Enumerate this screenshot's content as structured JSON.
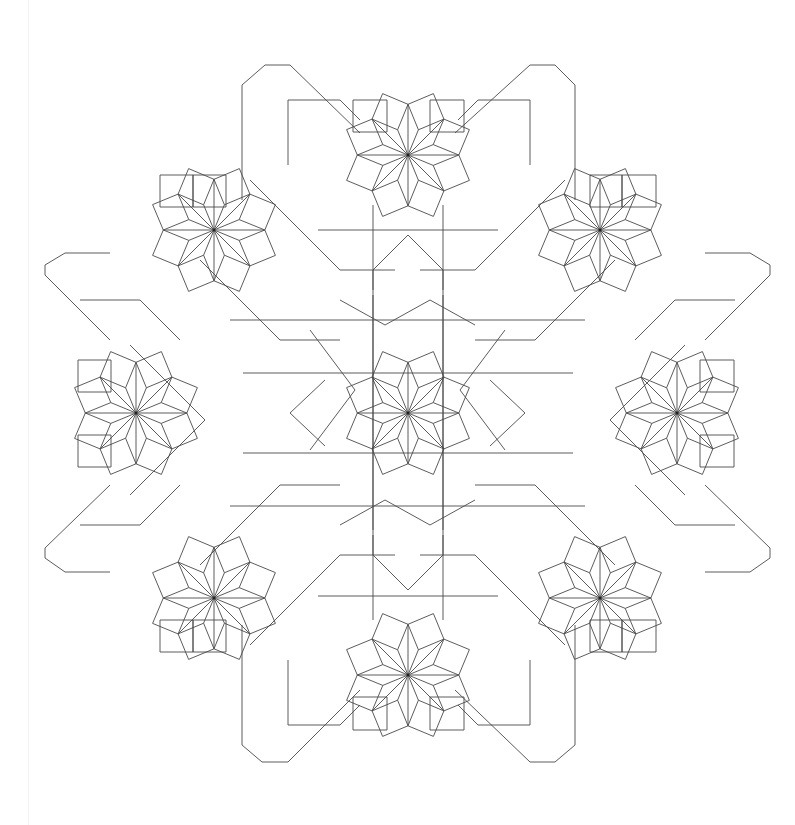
{
  "figure": {
    "title": "",
    "stroke_color": "#4a4a4a",
    "background": "#ffffff",
    "center": [
      408,
      413
    ],
    "unit": 35,
    "rosettes": [
      {
        "name": "center",
        "x": 408,
        "y": 413
      },
      {
        "name": "top",
        "x": 408,
        "y": 155
      },
      {
        "name": "bottom",
        "x": 408,
        "y": 675
      },
      {
        "name": "left",
        "x": 136,
        "y": 413
      },
      {
        "name": "right",
        "x": 677,
        "y": 413
      },
      {
        "name": "top-left",
        "x": 214,
        "y": 230
      },
      {
        "name": "top-right",
        "x": 600,
        "y": 230
      },
      {
        "name": "bottom-left",
        "x": 214,
        "y": 598
      },
      {
        "name": "bottom-right",
        "x": 600,
        "y": 598
      }
    ],
    "outer_squares": [
      [
        353,
        100,
        387,
        132
      ],
      [
        430,
        100,
        464,
        132
      ],
      [
        160,
        175,
        193,
        207
      ],
      [
        193,
        175,
        226,
        207
      ],
      [
        622,
        175,
        656,
        207
      ],
      [
        590,
        175,
        622,
        207
      ],
      [
        78,
        360,
        111,
        392
      ],
      [
        78,
        435,
        111,
        467
      ],
      [
        700,
        360,
        734,
        392
      ],
      [
        700,
        435,
        734,
        467
      ],
      [
        160,
        620,
        193,
        652
      ],
      [
        193,
        620,
        226,
        652
      ],
      [
        590,
        620,
        622,
        652
      ],
      [
        622,
        620,
        656,
        652
      ],
      [
        353,
        697,
        387,
        730
      ],
      [
        430,
        697,
        464,
        730
      ]
    ],
    "outer_frame": [
      [
        [
          242,
          95
        ],
        [
          242,
          85
        ],
        [
          265,
          65
        ],
        [
          290,
          65
        ],
        [
          360,
          133
        ]
      ],
      [
        [
          575,
          95
        ],
        [
          575,
          85
        ],
        [
          555,
          65
        ],
        [
          530,
          65
        ],
        [
          455,
          133
        ]
      ],
      [
        [
          45,
          275
        ],
        [
          45,
          265
        ],
        [
          65,
          253
        ],
        [
          110,
          253
        ]
      ],
      [
        [
          770,
          275
        ],
        [
          770,
          265
        ],
        [
          750,
          253
        ],
        [
          705,
          253
        ]
      ],
      [
        [
          45,
          548
        ],
        [
          45,
          558
        ],
        [
          65,
          572
        ],
        [
          110,
          572
        ]
      ],
      [
        [
          770,
          548
        ],
        [
          770,
          558
        ],
        [
          750,
          572
        ],
        [
          705,
          572
        ]
      ],
      [
        [
          242,
          732
        ],
        [
          242,
          745
        ],
        [
          262,
          762
        ],
        [
          288,
          762
        ],
        [
          360,
          690
        ]
      ],
      [
        [
          575,
          732
        ],
        [
          575,
          745
        ],
        [
          555,
          762
        ],
        [
          530,
          762
        ],
        [
          455,
          690
        ]
      ],
      [
        [
          242,
          95
        ],
        [
          242,
          200
        ]
      ],
      [
        [
          575,
          95
        ],
        [
          575,
          200
        ]
      ],
      [
        [
          242,
          732
        ],
        [
          242,
          625
        ]
      ],
      [
        [
          575,
          732
        ],
        [
          575,
          625
        ]
      ],
      [
        [
          45,
          275
        ],
        [
          110,
          340
        ]
      ],
      [
        [
          770,
          275
        ],
        [
          705,
          340
        ]
      ],
      [
        [
          45,
          548
        ],
        [
          110,
          485
        ]
      ],
      [
        [
          770,
          548
        ],
        [
          705,
          485
        ]
      ]
    ],
    "connector_paths": [
      [
        [
          288,
          100
        ],
        [
          340,
          100
        ],
        [
          360,
          120
        ]
      ],
      [
        [
          530,
          100
        ],
        [
          478,
          100
        ],
        [
          458,
          120
        ]
      ],
      [
        [
          288,
          100
        ],
        [
          288,
          165
        ]
      ],
      [
        [
          530,
          100
        ],
        [
          530,
          165
        ]
      ],
      [
        [
          288,
          725
        ],
        [
          340,
          725
        ],
        [
          360,
          705
        ]
      ],
      [
        [
          530,
          725
        ],
        [
          478,
          725
        ],
        [
          458,
          705
        ]
      ],
      [
        [
          288,
          725
        ],
        [
          288,
          660
        ]
      ],
      [
        [
          530,
          725
        ],
        [
          530,
          660
        ]
      ],
      [
        [
          80,
          300
        ],
        [
          140,
          300
        ],
        [
          180,
          340
        ]
      ],
      [
        [
          735,
          300
        ],
        [
          675,
          300
        ],
        [
          635,
          340
        ]
      ],
      [
        [
          80,
          525
        ],
        [
          140,
          525
        ],
        [
          180,
          485
        ]
      ],
      [
        [
          735,
          525
        ],
        [
          675,
          525
        ],
        [
          635,
          485
        ]
      ],
      [
        [
          373,
          205
        ],
        [
          373,
          530
        ]
      ],
      [
        [
          443,
          205
        ],
        [
          443,
          530
        ]
      ],
      [
        [
          373,
          620
        ],
        [
          373,
          295
        ]
      ],
      [
        [
          443,
          620
        ],
        [
          443,
          295
        ]
      ],
      [
        [
          243,
          373
        ],
        [
          573,
          373
        ]
      ],
      [
        [
          243,
          453
        ],
        [
          573,
          453
        ]
      ],
      [
        [
          318,
          230
        ],
        [
          498,
          230
        ]
      ],
      [
        [
          318,
          596
        ],
        [
          498,
          596
        ]
      ],
      [
        [
          230,
          320
        ],
        [
          585,
          320
        ]
      ],
      [
        [
          230,
          506
        ],
        [
          585,
          506
        ]
      ],
      [
        [
          408,
          235
        ],
        [
          373,
          270
        ],
        [
          373,
          290
        ]
      ],
      [
        [
          408,
          235
        ],
        [
          443,
          270
        ],
        [
          443,
          290
        ]
      ],
      [
        [
          408,
          590
        ],
        [
          373,
          555
        ],
        [
          373,
          535
        ]
      ],
      [
        [
          408,
          590
        ],
        [
          443,
          555
        ],
        [
          443,
          535
        ]
      ],
      [
        [
          290,
          413
        ],
        [
          325,
          380
        ]
      ],
      [
        [
          290,
          413
        ],
        [
          325,
          446
        ]
      ],
      [
        [
          525,
          413
        ],
        [
          490,
          380
        ]
      ],
      [
        [
          525,
          413
        ],
        [
          490,
          446
        ]
      ],
      [
        [
          200,
          260
        ],
        [
          280,
          340
        ],
        [
          340,
          340
        ]
      ],
      [
        [
          615,
          260
        ],
        [
          535,
          340
        ],
        [
          475,
          340
        ]
      ],
      [
        [
          200,
          565
        ],
        [
          280,
          485
        ],
        [
          340,
          485
        ]
      ],
      [
        [
          615,
          565
        ],
        [
          535,
          485
        ],
        [
          475,
          485
        ]
      ],
      [
        [
          250,
          180
        ],
        [
          340,
          270
        ],
        [
          395,
          270
        ]
      ],
      [
        [
          565,
          180
        ],
        [
          475,
          270
        ],
        [
          420,
          270
        ]
      ],
      [
        [
          250,
          645
        ],
        [
          340,
          555
        ],
        [
          395,
          555
        ]
      ],
      [
        [
          565,
          645
        ],
        [
          475,
          555
        ],
        [
          420,
          555
        ]
      ],
      [
        [
          130,
          345
        ],
        [
          205,
          420
        ],
        [
          130,
          495
        ]
      ],
      [
        [
          685,
          345
        ],
        [
          610,
          420
        ],
        [
          685,
          495
        ]
      ],
      [
        [
          340,
          300
        ],
        [
          385,
          325
        ],
        [
          430,
          300
        ],
        [
          475,
          325
        ]
      ],
      [
        [
          340,
          525
        ],
        [
          385,
          500
        ],
        [
          430,
          525
        ],
        [
          475,
          500
        ]
      ],
      [
        [
          310,
          330
        ],
        [
          355,
          390
        ],
        [
          310,
          450
        ]
      ],
      [
        [
          505,
          330
        ],
        [
          460,
          390
        ],
        [
          505,
          450
        ]
      ]
    ]
  }
}
